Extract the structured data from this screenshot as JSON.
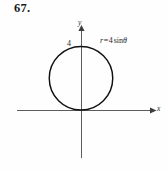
{
  "figure": {
    "problem_number": "67.",
    "background_color": "#fefefe",
    "ink_color": "#1a1a1a",
    "axis_color": "#4a4a4a",
    "curve_color": "#111111",
    "axes": {
      "y_label": "y",
      "x_label": "x",
      "y_tick_label": "4",
      "origin_px": {
        "x": 81,
        "y": 110
      }
    },
    "equation": {
      "full_text": "r = 4 sin θ",
      "variable": "r",
      "equals": "=",
      "coefficient": "4",
      "function": "sin",
      "angle": "θ"
    }
  },
  "chart_data": {
    "type": "line",
    "subtitle": "",
    "coordinate_system": "polar",
    "xlabel": "x",
    "ylabel": "y",
    "grid": false,
    "legend_position": "none",
    "annotations": [
      {
        "text": "r = 4 sin θ",
        "x": 4.2,
        "y": 4.4
      },
      {
        "text": "4",
        "x": -0.45,
        "y": 4.0
      }
    ],
    "tick_labels": {
      "y": [
        "4"
      ],
      "x": []
    },
    "axis_ranges": {
      "x": [
        -4.6,
        5.1
      ],
      "y": [
        -3.4,
        5.0
      ]
    },
    "series": [
      {
        "name": "r = 4 sin θ",
        "equation": "r = 4*sin(theta)",
        "shape": "circle",
        "center": {
          "x": 0,
          "y": 2
        },
        "radius": 2,
        "diameter": 4,
        "theta_range_deg": [
          0,
          180
        ],
        "passes_through": [
          {
            "x": 0,
            "y": 0,
            "theta_deg": 0,
            "r": 0
          },
          {
            "x": 2,
            "y": 2,
            "theta_deg": 45,
            "r": 2.828
          },
          {
            "x": 0,
            "y": 4,
            "theta_deg": 90,
            "r": 4
          },
          {
            "x": -2,
            "y": 2,
            "theta_deg": 135,
            "r": 2.828
          },
          {
            "x": 0,
            "y": 0,
            "theta_deg": 180,
            "r": 0
          }
        ],
        "points_polar": [
          {
            "theta_deg": 0,
            "r": 0.0
          },
          {
            "theta_deg": 15,
            "r": 1.035
          },
          {
            "theta_deg": 30,
            "r": 2.0
          },
          {
            "theta_deg": 45,
            "r": 2.828
          },
          {
            "theta_deg": 60,
            "r": 3.464
          },
          {
            "theta_deg": 75,
            "r": 3.864
          },
          {
            "theta_deg": 90,
            "r": 4.0
          },
          {
            "theta_deg": 105,
            "r": 3.864
          },
          {
            "theta_deg": 120,
            "r": 3.464
          },
          {
            "theta_deg": 135,
            "r": 2.828
          },
          {
            "theta_deg": 150,
            "r": 2.0
          },
          {
            "theta_deg": 165,
            "r": 1.035
          },
          {
            "theta_deg": 180,
            "r": 0.0
          }
        ]
      }
    ]
  }
}
